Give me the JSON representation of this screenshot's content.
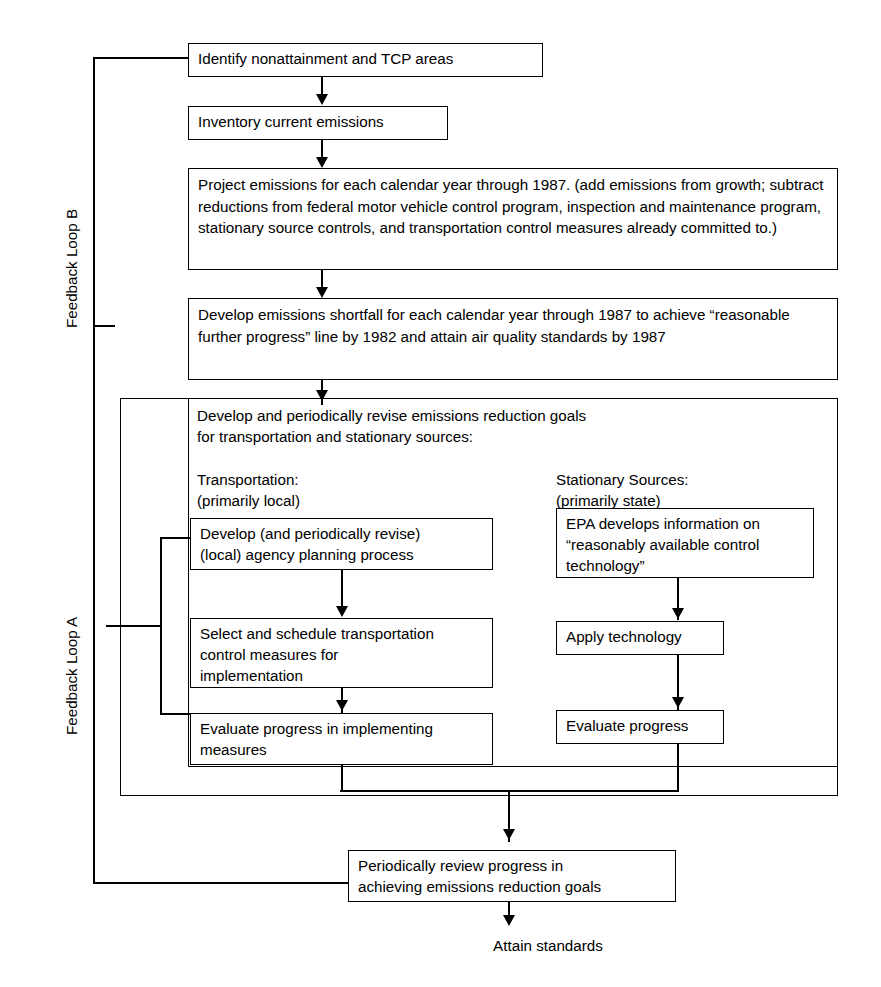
{
  "diagram": {
    "line_color": "#000000",
    "background_color": "#ffffff"
  },
  "nodes": {
    "identify": "Identify nonattainment and TCP areas",
    "inventory": "Inventory current emissions",
    "project": "Project emissions for each calendar year through 1987.  (add emissions from growth; subtract reductions from federal motor vehicle control program, inspection and maintenance program, stationary source controls, and transportation control measures already committed to.)",
    "shortfall": "Develop emissions shortfall for each calendar year through 1987 to achieve “reasonable further progress” line by 1982 and attain air quality standards by 1987",
    "goals_heading": "Develop and periodically revise emissions reduction goals\nfor transportation and stationary sources:",
    "transportation_heading": "Transportation:\n(primarily local)",
    "stationary_heading": "Stationary Sources:\n(primarily state)",
    "develop_agency": "Develop (and periodically revise)\n(local) agency planning process",
    "select_schedule": "Select and schedule transportation\ncontrol measures for\nimplementation",
    "evaluate_implementing": "Evaluate progress in implementing\nmeasures",
    "epa_develops": "EPA develops information on\n“reasonably available control\ntechnology”",
    "apply_technology": "Apply technology",
    "evaluate_progress": "Evaluate progress",
    "periodic_review": "Periodically review progress in\nachieving emissions reduction goals",
    "attain": "Attain standards"
  },
  "loops": {
    "loop_a": "Feedback Loop A",
    "loop_b": "Feedback Loop B"
  }
}
